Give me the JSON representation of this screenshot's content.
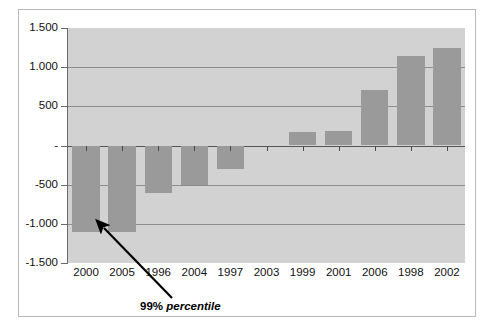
{
  "chart_data": {
    "type": "bar",
    "title": "",
    "subtitle": "",
    "xlabel": "",
    "ylabel": "",
    "categories": [
      "2000",
      "2005",
      "1996",
      "2004",
      "1997",
      "2003",
      "1999",
      "2001",
      "2006",
      "1998",
      "2002"
    ],
    "values": [
      -1100,
      -1100,
      -600,
      -510,
      -300,
      0,
      170,
      180,
      710,
      1140,
      1250
    ],
    "series": [
      {
        "name": "value",
        "values": [
          -1100,
          -1100,
          -600,
          -510,
          -300,
          0,
          170,
          180,
          710,
          1140,
          1250
        ]
      }
    ],
    "ylim": [
      -1500,
      1500
    ],
    "ytick_values": [
      1500,
      1000,
      500,
      0,
      -500,
      -1000,
      -1500
    ],
    "ytick_labels": [
      "1.500",
      "1.000",
      "500",
      "-",
      "-500",
      "-1.000",
      "-1.500"
    ],
    "grid": true,
    "legend": "none",
    "legend_position": "none",
    "annotations": [
      {
        "name": "percentile-callout",
        "text_bold": "99%",
        "text_italic": "percentile",
        "full_text": "99% percentile",
        "points_to_category": "2005",
        "points_to_value": -1100
      }
    ],
    "colors": {
      "bar": "#9a9a9a",
      "plot_background": "#d2d2d2",
      "gridline": "#8e8e8e",
      "axis": "#6b6b6b",
      "text": "#111111",
      "annotation": "#000000",
      "figure_background": "#ffffff",
      "frame": "#b9b9b9"
    }
  }
}
